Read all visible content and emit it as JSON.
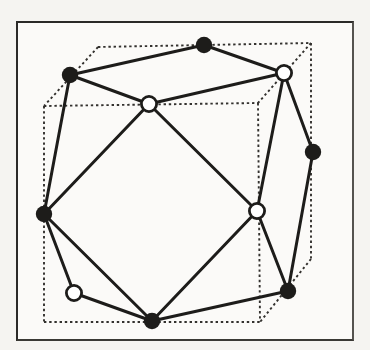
{
  "figure": {
    "kind": "polyhedron-in-cube-wireframe",
    "colors": {
      "ink": "#1d1c1a",
      "dash_ink": "#33312e",
      "open_node_fill": "#ffffff",
      "paper": "#fbfaf8",
      "margin_paper": "#f5f4f1",
      "frame_border": "#2b2a28"
    },
    "style": {
      "edge_width": 3,
      "dash_width": 1.9,
      "dash_pattern": "2.4 2.8",
      "node_radius_filled": 8.2,
      "node_radius_open": 7.6,
      "open_stroke_width": 2.8
    },
    "cube": {
      "corners": {
        "BTL": [
          98,
          47
        ],
        "BTR": [
          311,
          43
        ],
        "FTL": [
          44,
          106
        ],
        "FTR": [
          258,
          103
        ],
        "FBL": [
          44,
          322
        ],
        "FBR": [
          260,
          322
        ],
        "BBR": [
          311,
          259
        ]
      },
      "dashed_edges": [
        [
          "BTL",
          "BTR"
        ],
        [
          "BTL",
          "FTL"
        ],
        [
          "BTR",
          "FTR"
        ],
        [
          "FTL",
          "FTR"
        ],
        [
          "FTL",
          "FBL"
        ],
        [
          "BTR",
          "BBR"
        ],
        [
          "FTR",
          "FBR"
        ],
        [
          "FBL",
          "FBR"
        ],
        [
          "BBR",
          "FBR"
        ]
      ]
    },
    "nodes": [
      {
        "id": "n1",
        "x": 204,
        "y": 45,
        "type": "filled"
      },
      {
        "id": "n2",
        "x": 284,
        "y": 73,
        "type": "open"
      },
      {
        "id": "n3",
        "x": 70,
        "y": 75,
        "type": "filled"
      },
      {
        "id": "n4",
        "x": 149,
        "y": 104,
        "type": "open"
      },
      {
        "id": "n5",
        "x": 313,
        "y": 152,
        "type": "filled"
      },
      {
        "id": "n6",
        "x": 44,
        "y": 214,
        "type": "filled"
      },
      {
        "id": "n7",
        "x": 257,
        "y": 211,
        "type": "open"
      },
      {
        "id": "n8",
        "x": 74,
        "y": 293,
        "type": "open"
      },
      {
        "id": "n9",
        "x": 152,
        "y": 321,
        "type": "filled"
      },
      {
        "id": "n10",
        "x": 288,
        "y": 291,
        "type": "filled"
      }
    ],
    "solid_edges": [
      [
        "n1",
        "n2"
      ],
      [
        "n1",
        "n3"
      ],
      [
        "n2",
        "n4"
      ],
      [
        "n2",
        "n5"
      ],
      [
        "n2",
        "n7"
      ],
      [
        "n3",
        "n4"
      ],
      [
        "n3",
        "n6"
      ],
      [
        "n4",
        "n6"
      ],
      [
        "n4",
        "n7"
      ],
      [
        "n5",
        "n10"
      ],
      [
        "n6",
        "n8"
      ],
      [
        "n6",
        "n9"
      ],
      [
        "n7",
        "n9"
      ],
      [
        "n7",
        "n10"
      ],
      [
        "n8",
        "n9"
      ],
      [
        "n9",
        "n10"
      ]
    ]
  }
}
